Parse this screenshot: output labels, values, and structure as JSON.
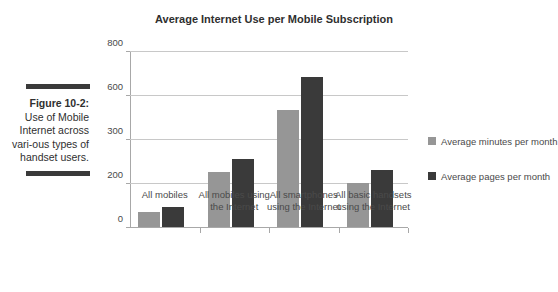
{
  "caption": {
    "label": "Figure 10-2:",
    "body": "Use of Mobile Internet across vari-ous types of handset users."
  },
  "chart_data": {
    "type": "bar",
    "title": "Average Internet Use per Mobile Subscription",
    "xlabel": "",
    "ylabel": "",
    "categories": [
      "All mobiles",
      "All mobiles using the Internet",
      "All smartphones using the Internet",
      "All basic handsets using the Internet"
    ],
    "series": [
      {
        "name": "Average minutes per month",
        "color": "#969696",
        "values": [
          70,
          250,
          530,
          200
        ]
      },
      {
        "name": "Average pages per month",
        "color": "#3a3a3a",
        "values": [
          90,
          310,
          680,
          258
        ]
      }
    ],
    "ylim": [
      0,
      800
    ],
    "ytick_values": [
      0,
      200,
      400,
      600,
      800
    ],
    "ytick_labels": [
      "0",
      "200",
      "300",
      "600",
      "800"
    ],
    "grid": true,
    "legend_position": "right"
  }
}
